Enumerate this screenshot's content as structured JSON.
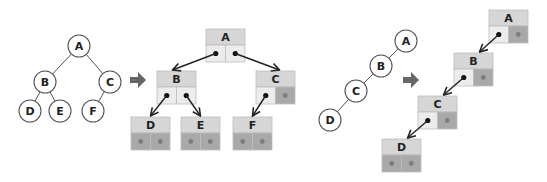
{
  "diagram": {
    "colors": {
      "circle_stroke": "#555555",
      "edge": "#555555",
      "node_header": "#d6d6d6",
      "pointer_cell": "#ececec",
      "null_cell": "#a9a9a9",
      "null_dot": "#7d7d7d",
      "pointer_dot": "#111111",
      "convert_arrow": "#666666",
      "link_arrow": "#222222"
    },
    "complete_tree": {
      "nodes": [
        {
          "id": "A",
          "label": "A",
          "x": 79,
          "y": 46
        },
        {
          "id": "B",
          "label": "B",
          "x": 45,
          "y": 82
        },
        {
          "id": "C",
          "label": "C",
          "x": 110,
          "y": 82
        },
        {
          "id": "D",
          "label": "D",
          "x": 30,
          "y": 111
        },
        {
          "id": "E",
          "label": "E",
          "x": 60,
          "y": 111
        },
        {
          "id": "F",
          "label": "F",
          "x": 93,
          "y": 111
        }
      ],
      "edges": [
        [
          "A",
          "B"
        ],
        [
          "A",
          "C"
        ],
        [
          "B",
          "D"
        ],
        [
          "B",
          "E"
        ],
        [
          "C",
          "F"
        ]
      ]
    },
    "complete_linked": {
      "nodes": [
        {
          "id": "A",
          "label": "A",
          "x": 206,
          "y": 29,
          "left": "ptr",
          "right": "ptr"
        },
        {
          "id": "B",
          "label": "B",
          "x": 157,
          "y": 71,
          "left": "ptr",
          "right": "ptr"
        },
        {
          "id": "C",
          "label": "C",
          "x": 256,
          "y": 71,
          "left": "ptr",
          "right": "null"
        },
        {
          "id": "D",
          "label": "D",
          "x": 131,
          "y": 117,
          "left": "null",
          "right": "null"
        },
        {
          "id": "E",
          "label": "E",
          "x": 181,
          "y": 117,
          "left": "null",
          "right": "null"
        },
        {
          "id": "F",
          "label": "F",
          "x": 233,
          "y": 117,
          "left": "null",
          "right": "null"
        }
      ]
    },
    "skewed_tree": {
      "nodes": [
        {
          "id": "A",
          "label": "A",
          "x": 406,
          "y": 41
        },
        {
          "id": "B",
          "label": "B",
          "x": 381,
          "y": 66
        },
        {
          "id": "C",
          "label": "C",
          "x": 356,
          "y": 91
        },
        {
          "id": "D",
          "label": "D",
          "x": 330,
          "y": 120
        }
      ],
      "edges": [
        [
          "A",
          "B"
        ],
        [
          "B",
          "C"
        ],
        [
          "C",
          "D"
        ]
      ]
    },
    "skewed_linked": {
      "nodes": [
        {
          "id": "A",
          "label": "A",
          "x": 489,
          "y": 10,
          "left": "ptr",
          "right": "null"
        },
        {
          "id": "B",
          "label": "B",
          "x": 454,
          "y": 53,
          "left": "ptr",
          "right": "null"
        },
        {
          "id": "C",
          "label": "C",
          "x": 418,
          "y": 96,
          "left": "ptr",
          "right": "null"
        },
        {
          "id": "D",
          "label": "D",
          "x": 382,
          "y": 139,
          "left": "null",
          "right": "null"
        }
      ]
    },
    "convert_arrows": [
      {
        "name": "convert-arrow-complete",
        "x": 130,
        "y": 72
      },
      {
        "name": "convert-arrow-skewed",
        "x": 403,
        "y": 72
      }
    ]
  }
}
